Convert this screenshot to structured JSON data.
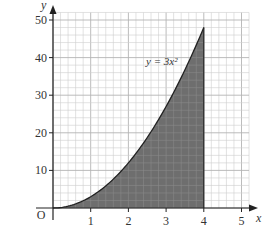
{
  "chart_data": {
    "type": "area",
    "title": "",
    "function": "y = 3x^2",
    "curve_label": "y = 3x²",
    "shaded_region": {
      "from_x": 0,
      "to_x": 4,
      "description": "area under y = 3x² between x = 0 and x = 4"
    },
    "x": [
      0,
      0.5,
      1,
      1.5,
      2,
      2.5,
      3,
      3.5,
      4
    ],
    "series": [
      {
        "name": "y = 3x²",
        "values": [
          0,
          0.75,
          3,
          6.75,
          12,
          18.75,
          27,
          36.75,
          48
        ]
      }
    ],
    "xlabel": "x",
    "ylabel": "y",
    "origin_label": "O",
    "xlim": [
      0,
      5.2
    ],
    "ylim": [
      0,
      52
    ],
    "x_ticks": [
      1,
      2,
      3,
      4,
      5
    ],
    "y_ticks": [
      10,
      20,
      30,
      40,
      50
    ],
    "grid": {
      "on": true,
      "x_minor_step": 0.2,
      "y_minor_step": 2,
      "x_major_step": 1,
      "y_major_step": 10
    },
    "legend": "none",
    "colors": {
      "fill": "#6e6e6e",
      "curve": "#222222",
      "grid_minor": "#cfcfcf",
      "grid_major": "#b4b4b4",
      "axis": "#222222"
    }
  }
}
